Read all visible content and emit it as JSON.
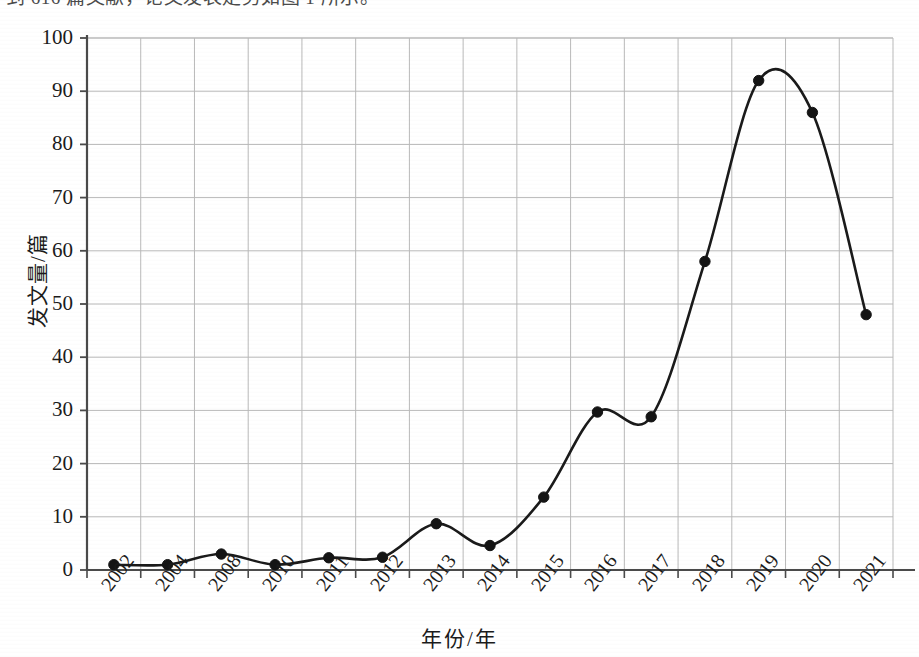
{
  "page": {
    "caption_text": "到 616 篇文献，论文发表走势如图 1 所示。"
  },
  "colors": {
    "line": "#1a1a1a",
    "marker": "#141414",
    "axis": "#4a4a4a",
    "grid": "#b9b9b9",
    "background": "#ffffff",
    "text": "#1b1b1b"
  },
  "chart_data": {
    "type": "line",
    "title": "",
    "xlabel": "年份/年",
    "ylabel": "发文量/篇",
    "categories": [
      "2002",
      "2004",
      "2008",
      "2010",
      "2011",
      "2012",
      "2013",
      "2014",
      "2015",
      "2016",
      "2017",
      "2018",
      "2019",
      "2020",
      "2021"
    ],
    "values": [
      1,
      1,
      3,
      1,
      2.3,
      2.4,
      8.7,
      4.6,
      13.7,
      29.7,
      28.8,
      58,
      92,
      86,
      48
    ],
    "series": [
      {
        "name": "发文量",
        "values": [
          1,
          1,
          3,
          1,
          2.3,
          2.4,
          8.7,
          4.6,
          13.7,
          29.7,
          28.8,
          58,
          92,
          86,
          48
        ]
      }
    ],
    "ylim": [
      0,
      100
    ],
    "ytick_values": [
      0,
      10,
      20,
      30,
      40,
      50,
      60,
      70,
      80,
      90,
      100
    ],
    "ytick_labels": [
      "0",
      "10",
      "20",
      "30",
      "40",
      "50",
      "60",
      "70",
      "80",
      "90",
      "100"
    ],
    "xtick_labels": [
      "2002",
      "2004",
      "2008",
      "2010",
      "2011",
      "2012",
      "2013",
      "2014",
      "2015",
      "2016",
      "2017",
      "2018",
      "2019",
      "2020",
      "2021"
    ],
    "grid": true,
    "legend": false,
    "legend_position": "none",
    "marker": "circle",
    "interpolation": "smooth",
    "annotations": []
  },
  "plot_geometry": {
    "left": 87,
    "right": 893,
    "top": 38,
    "bottom": 570
  }
}
